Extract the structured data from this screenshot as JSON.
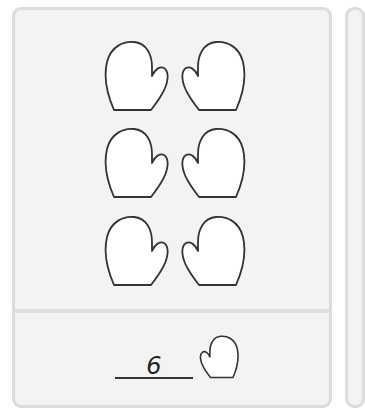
{
  "question": {
    "items": [
      {
        "row": 1,
        "side": "left",
        "icon": "mitten-icon"
      },
      {
        "row": 1,
        "side": "right",
        "icon": "mitten-icon"
      },
      {
        "row": 2,
        "side": "left",
        "icon": "mitten-icon"
      },
      {
        "row": 2,
        "side": "right",
        "icon": "mitten-icon"
      },
      {
        "row": 3,
        "side": "left",
        "icon": "mitten-icon"
      },
      {
        "row": 3,
        "side": "right",
        "icon": "mitten-icon"
      }
    ],
    "count": 6
  },
  "answer": {
    "value": "6",
    "unit_icon": "mitten-icon"
  },
  "colors": {
    "card_bg": "#f3f3f3",
    "card_border": "#dcdcdc",
    "mitten_fill": "#ffffff",
    "mitten_stroke": "#333333"
  }
}
